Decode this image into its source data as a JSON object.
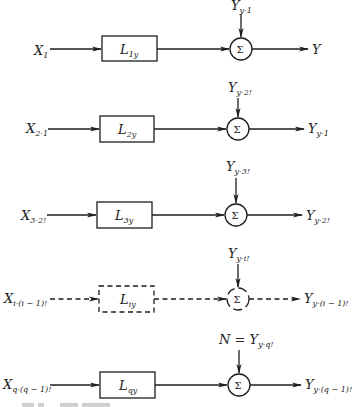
{
  "diagram": {
    "type": "block-diagram",
    "rows": [
      {
        "input": {
          "base": "X",
          "sub": "1"
        },
        "block": {
          "base": "L",
          "sub": "1y"
        },
        "side_input": {
          "prefix": "",
          "base": "Y",
          "sub": "y·1"
        },
        "output": {
          "base": "Y",
          "sub": ""
        },
        "style": "solid"
      },
      {
        "input": {
          "base": "X",
          "sub": "2·1"
        },
        "block": {
          "base": "L",
          "sub": "2y"
        },
        "side_input": {
          "prefix": "",
          "base": "Y",
          "sub": "y·2!"
        },
        "output": {
          "base": "Y",
          "sub": "y·1"
        },
        "style": "solid"
      },
      {
        "input": {
          "base": "X",
          "sub": "3·2!"
        },
        "block": {
          "base": "L",
          "sub": "3y"
        },
        "side_input": {
          "prefix": "",
          "base": "Y",
          "sub": "y·3!"
        },
        "output": {
          "base": "Y",
          "sub": "y·2!"
        },
        "style": "solid"
      },
      {
        "input": {
          "base": "X",
          "sub": "i·(i − 1)!"
        },
        "block": {
          "base": "L",
          "sub": "iy"
        },
        "side_input": {
          "prefix": "",
          "base": "Y",
          "sub": "y·i!"
        },
        "output": {
          "base": "Y",
          "sub": "y·(i − 1)!"
        },
        "style": "dashed"
      },
      {
        "input": {
          "base": "X",
          "sub": "q·(q − 1)!"
        },
        "block": {
          "base": "L",
          "sub": "qy"
        },
        "side_input": {
          "prefix": "N = ",
          "base": "Y",
          "sub": "y·q!"
        },
        "output": {
          "base": "Y",
          "sub": "y·(q − 1)!"
        },
        "style": "solid"
      }
    ],
    "summing_symbol": "Σ",
    "caption_fragment": "F IG. ... (caption text cut off at bottom edge, illegible)"
  }
}
